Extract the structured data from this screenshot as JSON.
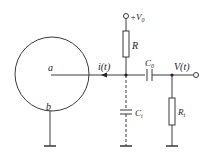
{
  "diagram": {
    "type": "circuit-schematic",
    "colors": {
      "stroke": "#3a3a3a",
      "background": "#ffffff"
    },
    "labels": {
      "node_a": "a",
      "node_b": "b",
      "current": "i(t)",
      "supply_main": "+V",
      "supply_sub": "0",
      "resistor_R": "R",
      "cap_coupling_main": "C",
      "cap_coupling_sub": "0",
      "output_voltage": "V(t)",
      "cap_input_main": "C",
      "cap_input_sub": "i",
      "resistor_input_main": "R",
      "resistor_input_sub": "i"
    },
    "components": [
      {
        "id": "detector",
        "kind": "circle-electrode",
        "terminals": [
          "a",
          "b"
        ]
      },
      {
        "id": "R",
        "kind": "resistor",
        "between": [
          "+V0",
          "junction"
        ]
      },
      {
        "id": "C0",
        "kind": "capacitor",
        "between": [
          "junction",
          "output"
        ]
      },
      {
        "id": "Ci",
        "kind": "capacitor",
        "style": "dashed",
        "between": [
          "junction",
          "ground"
        ]
      },
      {
        "id": "Ri",
        "kind": "resistor",
        "between": [
          "output",
          "ground"
        ]
      }
    ]
  }
}
